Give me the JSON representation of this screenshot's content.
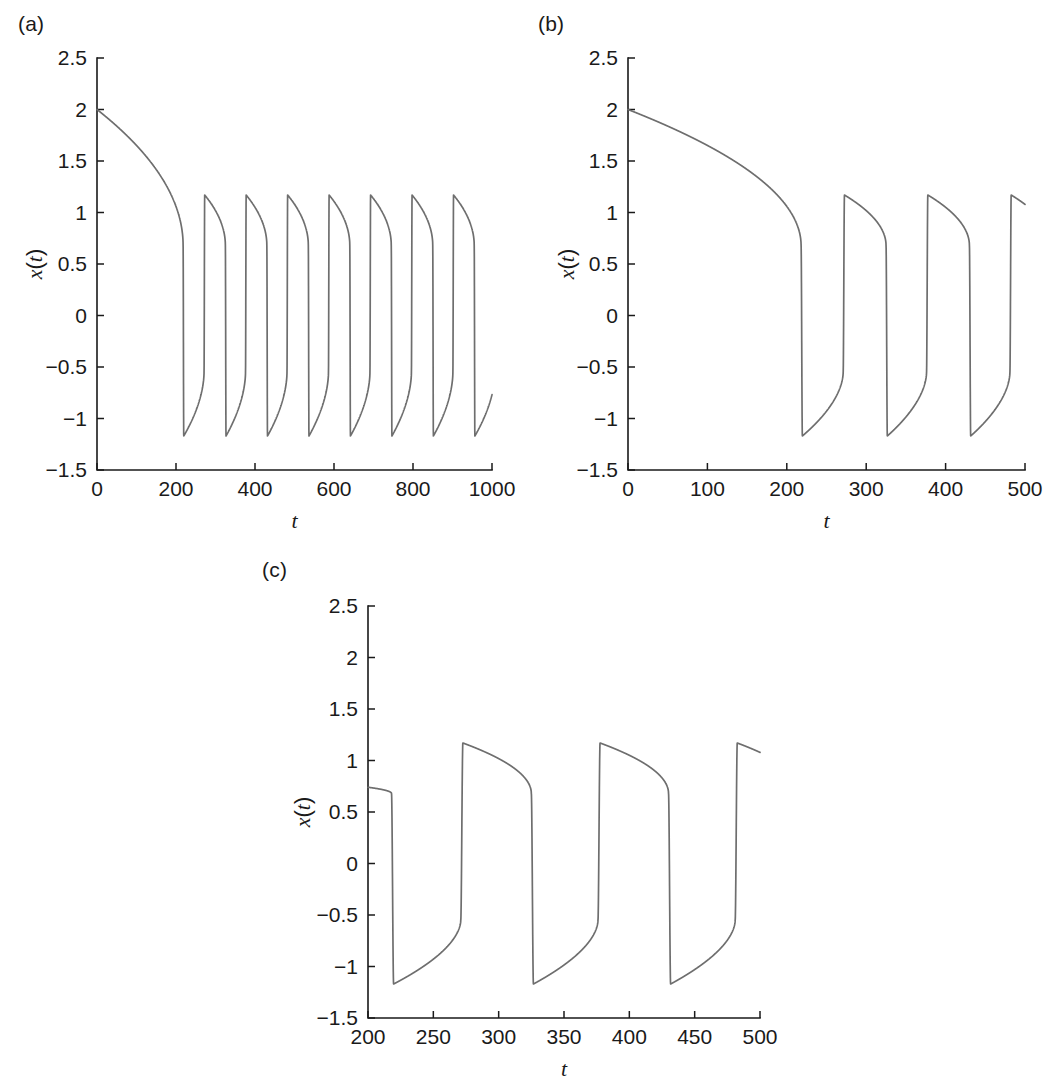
{
  "figure": {
    "background_color": "#ffffff",
    "line_color": "#6e6e6e",
    "axis_color": "#1a1a1a"
  },
  "panels": [
    {
      "label": "(a)",
      "ylabel": "x(t)",
      "xlabel": "t"
    },
    {
      "label": "(b)",
      "ylabel": "x(t)",
      "xlabel": "t"
    },
    {
      "label": "(c)",
      "ylabel": "x(t)",
      "xlabel": "t"
    }
  ],
  "chart_data": [
    {
      "type": "line",
      "panel": "(a)",
      "title": "",
      "xlabel": "t",
      "ylabel": "x(t)",
      "xlim": [
        0,
        1000
      ],
      "ylim": [
        -1.5,
        2.5
      ],
      "xticks": [
        0,
        200,
        400,
        600,
        800,
        1000
      ],
      "xticklabels": [
        "0",
        "200",
        "400",
        "600",
        "800",
        "1000"
      ],
      "yticks": [
        -1.5,
        -1,
        -0.5,
        0,
        0.5,
        1,
        1.5,
        2,
        2.5
      ],
      "yticklabels": [
        "-1.5",
        "-1",
        "-0.5",
        "0",
        "0.5",
        "1",
        "1.5",
        "2",
        "2.5"
      ],
      "grid": false,
      "legend": "none",
      "series": [
        {
          "name": "x(t)",
          "color": "#6e6e6e",
          "description": "Relaxation oscillator: slow transient decay from x=2 along upper branch until t=218, then repeated fast jumps between lower branch (-1.17) and upper branch (1.17) with period 105.",
          "initial_value": 2.0,
          "transient_end_t": 218,
          "transient_knee_x": 0.68,
          "period": 105,
          "upper_peak": 1.17,
          "lower_trough": -1.17,
          "jump_down_times": [
            218,
            325,
            430,
            535,
            640,
            745,
            850,
            955
          ],
          "jump_up_times": [
            271,
            376,
            481,
            586,
            691,
            796,
            901
          ],
          "final_value": 0.76,
          "n_complete_cycles": 8
        }
      ]
    },
    {
      "type": "line",
      "panel": "(b)",
      "title": "",
      "xlabel": "t",
      "ylabel": "x(t)",
      "xlim": [
        0,
        500
      ],
      "ylim": [
        -1.5,
        2.5
      ],
      "xticks": [
        0,
        100,
        200,
        300,
        400,
        500
      ],
      "xticklabels": [
        "0",
        "100",
        "200",
        "300",
        "400",
        "500"
      ],
      "yticks": [
        -1.5,
        -1,
        -0.5,
        0,
        0.5,
        1,
        1.5,
        2,
        2.5
      ],
      "yticklabels": [
        "-1.5",
        "-1",
        "-0.5",
        "0",
        "0.5",
        "1",
        "1.5",
        "2",
        "2.5"
      ],
      "grid": false,
      "legend": "none",
      "series": [
        {
          "name": "x(t)",
          "color": "#6e6e6e",
          "description": "Zoom of panel (a) over t in [0,500]: transient decay from 2.0 then three relaxation cycles.",
          "initial_value": 2.0,
          "transient_end_t": 218,
          "transient_knee_x": 0.68,
          "period": 105,
          "upper_peak": 1.17,
          "lower_trough": -1.17,
          "jump_down_times": [
            218,
            325,
            430
          ],
          "jump_up_times": [
            271,
            376,
            481
          ],
          "final_value": 1.03,
          "n_complete_cycles": 3
        }
      ]
    },
    {
      "type": "line",
      "panel": "(c)",
      "title": "",
      "xlabel": "t",
      "ylabel": "x(t)",
      "xlim": [
        200,
        500
      ],
      "ylim": [
        -1.5,
        2.5
      ],
      "xticks": [
        200,
        250,
        300,
        350,
        400,
        450,
        500
      ],
      "xticklabels": [
        "200",
        "250",
        "300",
        "350",
        "400",
        "450",
        "500"
      ],
      "yticks": [
        -1.5,
        -1,
        -0.5,
        0,
        0.5,
        1,
        1.5,
        2,
        2.5
      ],
      "yticklabels": [
        "-1.5",
        "-1",
        "-0.5",
        "0",
        "0.5",
        "1",
        "1.5",
        "2",
        "2.5"
      ],
      "grid": false,
      "legend": "none",
      "series": [
        {
          "name": "x(t)",
          "color": "#6e6e6e",
          "description": "Zoom of panel (a) over t in [200,500]: detail of three relaxation cycles showing fast jumps and slow branch motion.",
          "initial_value": 0.89,
          "period": 105,
          "upper_peak": 1.17,
          "lower_trough": -1.17,
          "jump_down_times": [
            218,
            325,
            430
          ],
          "jump_up_times": [
            271,
            376,
            481
          ],
          "final_value": 1.03,
          "n_complete_cycles": 3
        }
      ]
    }
  ]
}
